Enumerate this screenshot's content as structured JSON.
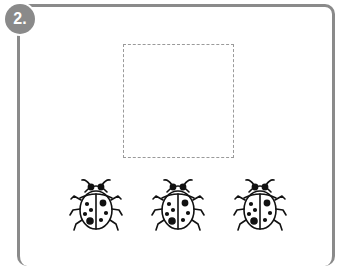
{
  "exercise": {
    "number_label": "2.",
    "drawing_area": "empty dashed square for drawing",
    "items": [
      {
        "name": "ladybug",
        "x": 68
      },
      {
        "name": "ladybug",
        "x": 150
      },
      {
        "name": "ladybug",
        "x": 232
      }
    ],
    "colors": {
      "border": "#8a8a8a",
      "dashed": "#9a9a9a",
      "ink": "#111111"
    }
  }
}
